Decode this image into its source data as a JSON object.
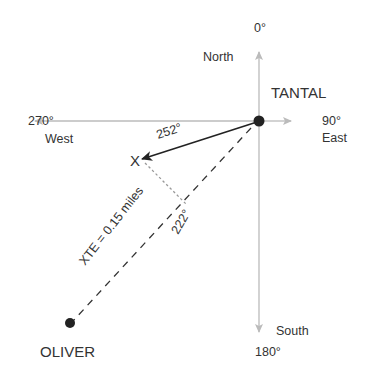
{
  "diagram": {
    "type": "cross-track-error navigation diagram",
    "compass": {
      "north_degrees": "0°",
      "north_label": "North",
      "east_degrees": "90°",
      "east_label": "East",
      "south_degrees": "180°",
      "south_label": "South",
      "west_degrees": "270°",
      "west_label": "West"
    },
    "waypoints": {
      "origin": "TANTAL",
      "destination": "OLIVER",
      "current_position_marker": "X"
    },
    "bearings": {
      "actual_track": "252°",
      "intended_course": "222°"
    },
    "xte_label": "XTE = 0.15 miles",
    "colors": {
      "axis": "#bbbbbb",
      "track": "#222222",
      "dots": "#222222",
      "text": "#333333"
    }
  }
}
